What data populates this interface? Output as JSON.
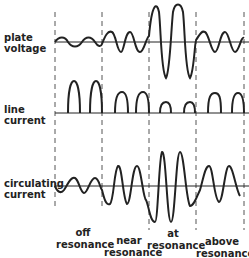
{
  "rows": [
    {
      "id": "plate-voltage",
      "label_line1": "plate",
      "label_line2": "voltage"
    },
    {
      "id": "line-current",
      "label_line1": "line",
      "label_line2": "current"
    },
    {
      "id": "circulating-current",
      "label_line1": "circulating",
      "label_line2": "current"
    }
  ],
  "columns": [
    {
      "id": "off-resonance",
      "line1": "off",
      "line2": "resonance"
    },
    {
      "id": "near-resonance",
      "line1": "near",
      "line2": "resonance"
    },
    {
      "id": "at-resonance",
      "line1": "at",
      "line2": "resonance"
    },
    {
      "id": "above-resonance",
      "line1": "above",
      "line2": "resonance"
    }
  ],
  "colors": {
    "ink": "#222222",
    "background": "#ffffff"
  }
}
